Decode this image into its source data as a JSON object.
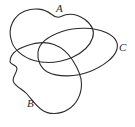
{
  "figure": {
    "type": "closed-curve-diagram",
    "background_color": "#ffffff",
    "stroke_color": "#2b2b2b",
    "labels": {
      "a": "A",
      "b": "B",
      "c": "C"
    }
  }
}
